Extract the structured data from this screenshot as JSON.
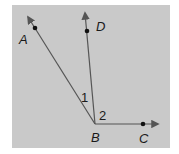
{
  "diagram": {
    "background_color": "#c9c9c9",
    "line_color": "#555555",
    "vertex": {
      "label": "B",
      "x": 95,
      "y": 124
    },
    "rays": [
      {
        "name": "BA",
        "point_label": "A",
        "point": [
          35,
          28
        ],
        "tip": [
          28,
          17
        ]
      },
      {
        "name": "BD",
        "point_label": "D",
        "point": [
          87,
          31
        ],
        "tip": [
          85,
          13
        ]
      },
      {
        "name": "BC",
        "point_label": "C",
        "point": [
          143,
          124
        ],
        "tip": [
          158,
          124
        ]
      }
    ],
    "labels": {
      "A": "A",
      "D": "D",
      "B": "B",
      "C": "C",
      "angle1": "1",
      "angle2": "2"
    }
  }
}
